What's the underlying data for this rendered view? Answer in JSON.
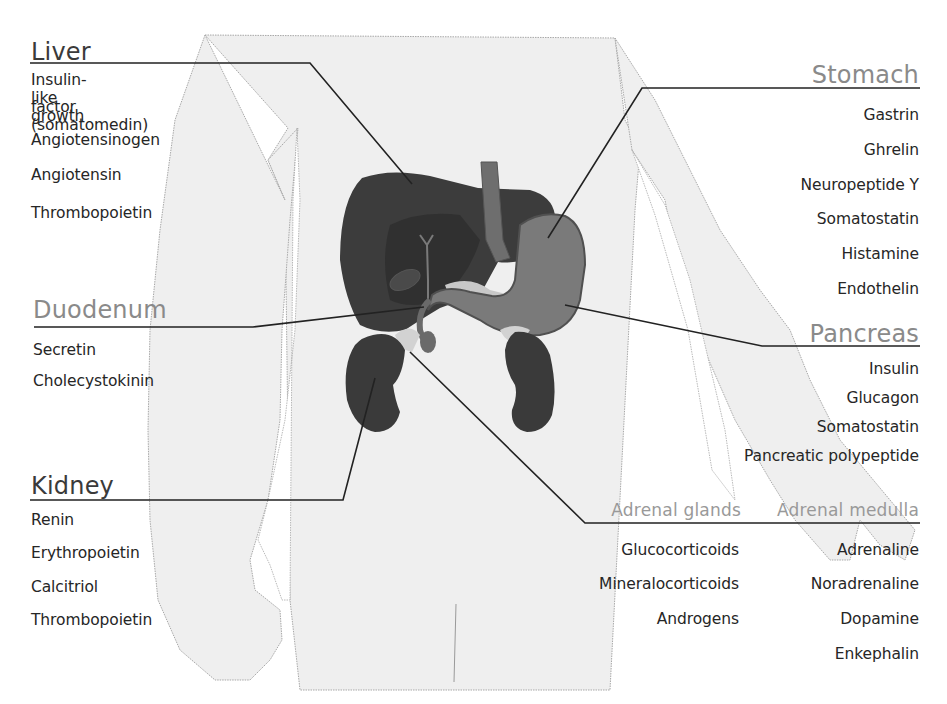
{
  "diagram": {
    "colors": {
      "background": "#ffffff",
      "body_silhouette": "#efefef",
      "silhouette_outline": "#a8a8a8",
      "liver": "#3c3c3c",
      "liver_shadow": "#2f2f2f",
      "gallbladder": "#4a4a4a",
      "stomach": "#7a7a7a",
      "stomach_outline": "#555555",
      "esophagus": "#6e6e6e",
      "kidney": "#3a3a3a",
      "pancreas": "#c8c8c8",
      "leader_line": "#222222",
      "heading_dark": "#3a3a3a",
      "heading_light": "#8a8a8a",
      "hormone_text": "#262626"
    },
    "organs": {
      "liver": {
        "heading": "Liver",
        "hormones": [
          "Insulin-like growth",
          "factor (somatomedin)",
          "Angiotensinogen",
          "Angiotensin",
          "Thrombopoietin"
        ]
      },
      "duodenum": {
        "heading": "Duodenum",
        "hormones": [
          "Secretin",
          "Cholecystokinin"
        ]
      },
      "kidney": {
        "heading": "Kidney",
        "hormones": [
          "Renin",
          "Erythropoietin",
          "Calcitriol",
          "Thrombopoietin"
        ]
      },
      "stomach": {
        "heading": "Stomach",
        "hormones": [
          "Gastrin",
          "Ghrelin",
          "Neuropeptide Y",
          "Somatostatin",
          "Histamine",
          "Endothelin"
        ]
      },
      "pancreas": {
        "heading": "Pancreas",
        "hormones": [
          "Insulin",
          "Glucagon",
          "Somatostatin",
          "Pancreatic polypeptide"
        ]
      },
      "adrenal_glands": {
        "heading": "Adrenal glands",
        "hormones": [
          "Glucocorticoids",
          "Mineralocorticoids",
          "Androgens"
        ]
      },
      "adrenal_medulla": {
        "heading": "Adrenal medulla",
        "hormones": [
          "Adrenaline",
          "Noradrenaline",
          "Dopamine",
          "Enkephalin"
        ]
      }
    }
  }
}
